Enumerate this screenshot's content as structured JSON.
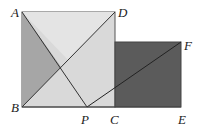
{
  "diagram": {
    "type": "geometry",
    "points": {
      "A": {
        "label": "A",
        "x": 22,
        "y": 12
      },
      "D": {
        "label": "D",
        "x": 115,
        "y": 12
      },
      "B": {
        "label": "B",
        "x": 22,
        "y": 107
      },
      "C": {
        "label": "C",
        "x": 115,
        "y": 107
      },
      "P": {
        "label": "P",
        "x": 87,
        "y": 107
      },
      "F": {
        "label": "F",
        "x": 181,
        "y": 42
      },
      "E": {
        "label": "E",
        "x": 181,
        "y": 107
      }
    },
    "shapes": [
      {
        "name": "square-ABCD",
        "fill": "#d6d6d6"
      },
      {
        "name": "square-CEF",
        "fill": "#5a5a5a"
      },
      {
        "name": "triangle-ABP",
        "fill": "#a8a8a8"
      }
    ],
    "segments": [
      "AB",
      "BC",
      "CD",
      "DA",
      "BD",
      "AP",
      "PF",
      "CE",
      "EF"
    ]
  }
}
